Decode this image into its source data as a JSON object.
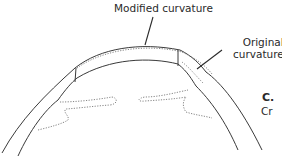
{
  "diagram": {
    "labels": {
      "modified_curvature": "Modified curvature",
      "original_curvature_line1": "Original",
      "original_curvature_line2": "curvature",
      "panel_letter": "C.",
      "panel_caption_partial": "Cr"
    },
    "colors": {
      "line": "#3a3a3a",
      "dotted": "#777777",
      "text": "#2a2a2a",
      "background": "#ffffff"
    }
  }
}
